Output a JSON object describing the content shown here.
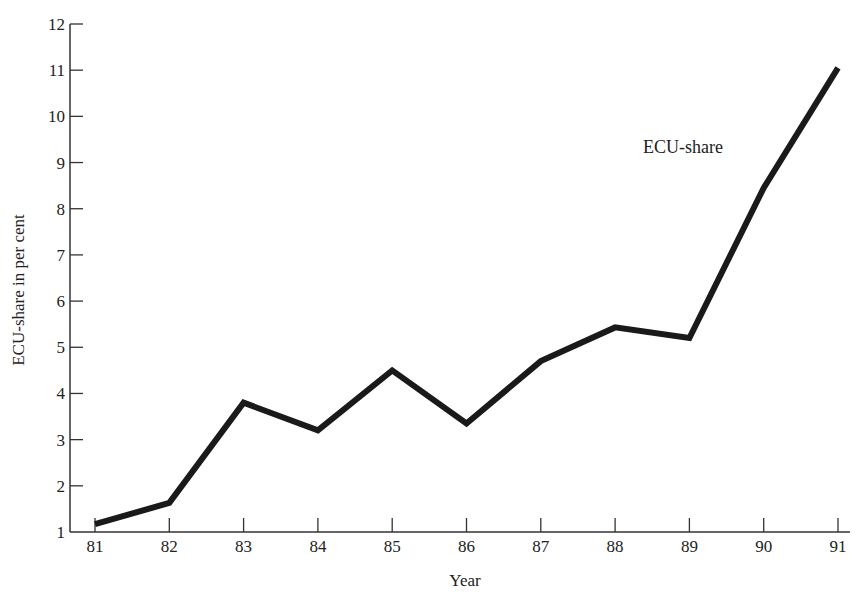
{
  "chart_data": {
    "type": "line",
    "title": "",
    "xlabel": "Year",
    "ylabel": "ECU-share in per cent",
    "categories": [
      "81",
      "82",
      "83",
      "84",
      "85",
      "86",
      "87",
      "88",
      "89",
      "90",
      "91"
    ],
    "series": [
      {
        "name": "ECU-share",
        "values": [
          1.17,
          1.63,
          3.8,
          3.2,
          4.5,
          3.35,
          4.7,
          5.43,
          5.2,
          8.45,
          11.05
        ]
      }
    ],
    "yticks": [
      "1",
      "2",
      "3",
      "4",
      "5",
      "6",
      "7",
      "8",
      "9",
      "10",
      "11",
      "12"
    ],
    "ylim": [
      1,
      12
    ],
    "grid": false,
    "legend": "none",
    "annotations": [
      {
        "text": "ECU-share",
        "near": "series line between 89 and 91"
      }
    ]
  },
  "labels": {
    "xlabel": "Year",
    "ylabel": "ECU-share in per cent",
    "series_annotation": "ECU-share"
  },
  "colors": {
    "line": "#1a1a1a",
    "axis": "#333333",
    "text": "#222222",
    "background": "#ffffff"
  }
}
